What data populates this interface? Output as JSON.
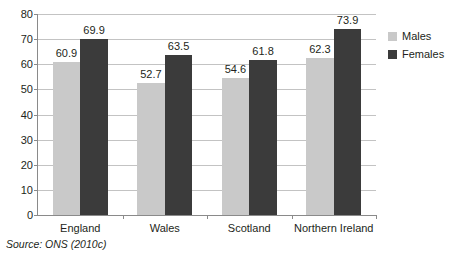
{
  "chart_data": {
    "type": "bar",
    "title": "",
    "xlabel": "",
    "ylabel": "",
    "ylim": [
      0,
      80
    ],
    "yticks": [
      0,
      10,
      20,
      30,
      40,
      50,
      60,
      70,
      80
    ],
    "grid": true,
    "legend_position": "right",
    "categories": [
      "England",
      "Wales",
      "Scotland",
      "Northern Ireland"
    ],
    "series": [
      {
        "name": "Males",
        "color": "#c9c9c9",
        "values": [
          60.9,
          52.7,
          54.6,
          62.3
        ]
      },
      {
        "name": "Females",
        "color": "#3b3b3b",
        "values": [
          69.9,
          63.5,
          61.8,
          73.9
        ]
      }
    ],
    "value_labels": {
      "England": {
        "Males": "60.9",
        "Females": "69.9"
      },
      "Wales": {
        "Males": "52.7",
        "Females": "63.5"
      },
      "Scotland": {
        "Males": "54.6",
        "Females": "61.8"
      },
      "Northern Ireland": {
        "Males": "62.3",
        "Females": "73.9"
      }
    }
  },
  "axis": {
    "y_tick_labels": [
      "0",
      "10",
      "20",
      "30",
      "40",
      "50",
      "60",
      "70",
      "80"
    ],
    "x_tick_labels": [
      "England",
      "Wales",
      "Scotland",
      "Northern Ireland"
    ]
  },
  "legend": {
    "items": [
      {
        "label": "Males",
        "color": "#c9c9c9"
      },
      {
        "label": "Females",
        "color": "#3b3b3b"
      }
    ]
  },
  "source": {
    "text": "Source: ONS (2010c)"
  },
  "colors": {
    "males": "#c9c9c9",
    "females": "#3b3b3b",
    "gridline": "#c3c3c3",
    "axis": "#8a8a8a",
    "text": "#231f20"
  }
}
